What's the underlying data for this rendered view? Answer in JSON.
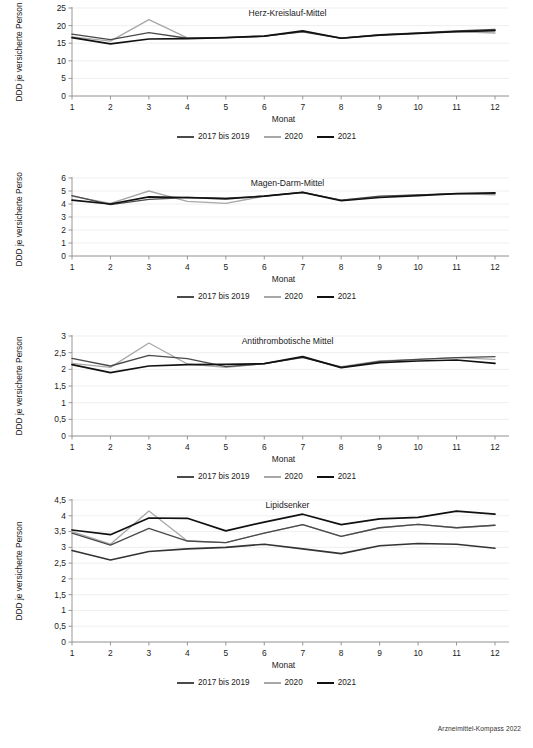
{
  "footer": {
    "source_label": "Arzneimittel-Kompass 2022"
  },
  "legend": {
    "items": [
      {
        "label": "2017 bis 2019",
        "color": "#4a4a4a"
      },
      {
        "label": "2020",
        "color": "#a8a8a8"
      },
      {
        "label": "2021",
        "color": "#111111"
      }
    ]
  },
  "axis_labels": {
    "x": "Monat",
    "y": "DDD je versicherte Person"
  },
  "chart_data": [
    {
      "type": "line",
      "title": "Herz-Kreislauf-Mittel",
      "xlabel": "Monat",
      "ylabel": "DDD je versicherte Person",
      "x": [
        1,
        2,
        3,
        4,
        5,
        6,
        7,
        8,
        9,
        10,
        11,
        12
      ],
      "categories": [
        "1",
        "2",
        "3",
        "4",
        "5",
        "6",
        "7",
        "8",
        "9",
        "10",
        "11",
        "12"
      ],
      "ylim": [
        0,
        25
      ],
      "yticks": [
        0,
        5,
        10,
        15,
        20,
        25
      ],
      "ytick_labels": [
        "0",
        "5",
        "10",
        "15",
        "20",
        "25"
      ],
      "grid": true,
      "legend_position": "bottom",
      "series": [
        {
          "name": "2017 bis 2019",
          "color": "#4a4a4a",
          "values": [
            17.6,
            16.0,
            18.0,
            16.4,
            16.6,
            17.0,
            18.2,
            16.4,
            17.4,
            17.9,
            18.5,
            18.9
          ]
        },
        {
          "name": "2020",
          "color": "#a8a8a8",
          "values": [
            16.8,
            15.6,
            21.7,
            16.5,
            16.6,
            17.0,
            18.3,
            16.5,
            17.3,
            17.8,
            18.3,
            17.9
          ]
        },
        {
          "name": "2021",
          "color": "#111111",
          "values": [
            16.6,
            14.8,
            16.2,
            16.3,
            16.6,
            17.0,
            18.5,
            16.4,
            17.3,
            17.8,
            18.3,
            18.6
          ]
        }
      ]
    },
    {
      "type": "line",
      "title": "Magen-Darm-Mittel",
      "xlabel": "Monat",
      "ylabel": "DDD je versicherte Person",
      "x": [
        1,
        2,
        3,
        4,
        5,
        6,
        7,
        8,
        9,
        10,
        11,
        12
      ],
      "categories": [
        "1",
        "2",
        "3",
        "4",
        "5",
        "6",
        "7",
        "8",
        "9",
        "10",
        "11",
        "12"
      ],
      "ylim": [
        0,
        6
      ],
      "yticks": [
        0,
        1,
        2,
        3,
        4,
        5,
        6
      ],
      "ytick_labels": [
        "0",
        "1",
        "2",
        "3",
        "4",
        "5",
        "6"
      ],
      "grid": true,
      "legend_position": "bottom",
      "series": [
        {
          "name": "2017 bis 2019",
          "color": "#4a4a4a",
          "values": [
            4.65,
            3.95,
            4.35,
            4.5,
            4.45,
            4.6,
            4.9,
            4.3,
            4.6,
            4.7,
            4.8,
            4.8
          ]
        },
        {
          "name": "2020",
          "color": "#a8a8a8",
          "values": [
            4.6,
            4.05,
            5.0,
            4.2,
            4.05,
            4.6,
            4.9,
            4.3,
            4.55,
            4.7,
            4.8,
            4.7
          ]
        },
        {
          "name": "2021",
          "color": "#111111",
          "values": [
            4.3,
            4.0,
            4.55,
            4.5,
            4.4,
            4.6,
            4.9,
            4.25,
            4.5,
            4.65,
            4.8,
            4.85
          ]
        }
      ]
    },
    {
      "type": "line",
      "title": "Antithrombotische Mittel",
      "xlabel": "Monat",
      "ylabel": "DDD je versicherte Person",
      "x": [
        1,
        2,
        3,
        4,
        5,
        6,
        7,
        8,
        9,
        10,
        11,
        12
      ],
      "categories": [
        "1",
        "2",
        "3",
        "4",
        "5",
        "6",
        "7",
        "8",
        "9",
        "10",
        "11",
        "12"
      ],
      "ylim": [
        0,
        3
      ],
      "yticks": [
        0,
        0.5,
        1,
        1.5,
        2,
        2.5,
        3
      ],
      "ytick_labels": [
        "0",
        "0,5",
        "1",
        "1,5",
        "2",
        "2,5",
        "3"
      ],
      "grid": true,
      "legend_position": "bottom",
      "series": [
        {
          "name": "2017 bis 2019",
          "color": "#4a4a4a",
          "values": [
            2.33,
            2.1,
            2.42,
            2.32,
            2.08,
            2.17,
            2.36,
            2.06,
            2.24,
            2.3,
            2.35,
            2.38
          ]
        },
        {
          "name": "2020",
          "color": "#a8a8a8",
          "values": [
            2.18,
            2.06,
            2.79,
            2.16,
            2.06,
            2.17,
            2.35,
            2.08,
            2.25,
            2.3,
            2.35,
            2.3
          ]
        },
        {
          "name": "2021",
          "color": "#111111",
          "values": [
            2.14,
            1.9,
            2.1,
            2.14,
            2.15,
            2.17,
            2.38,
            2.05,
            2.2,
            2.25,
            2.28,
            2.18
          ]
        }
      ]
    },
    {
      "type": "line",
      "title": "Lipidsenker",
      "xlabel": "Monat",
      "ylabel": "DDD je versicherte Person",
      "x": [
        1,
        2,
        3,
        4,
        5,
        6,
        7,
        8,
        9,
        10,
        11,
        12
      ],
      "categories": [
        "1",
        "2",
        "3",
        "4",
        "5",
        "6",
        "7",
        "8",
        "9",
        "10",
        "11",
        "12"
      ],
      "ylim": [
        0,
        4.5
      ],
      "yticks": [
        0,
        0.5,
        1,
        1.5,
        2,
        2.5,
        3,
        3.5,
        4,
        4.5
      ],
      "ytick_labels": [
        "0",
        "0,5",
        "1",
        "1,5",
        "2",
        "2,5",
        "3",
        "3,5",
        "4",
        "4,5"
      ],
      "grid": true,
      "legend_position": "bottom",
      "series": [
        {
          "name": "2017 bis 2019",
          "color": "#4a4a4a",
          "values": [
            3.45,
            3.07,
            3.6,
            3.2,
            3.15,
            3.45,
            3.72,
            3.35,
            3.62,
            3.73,
            3.62,
            3.7
          ]
        },
        {
          "name": "2020",
          "color": "#a8a8a8",
          "values": [
            3.5,
            3.1,
            4.15,
            3.2,
            3.15,
            3.45,
            3.72,
            3.35,
            3.62,
            3.73,
            3.62,
            3.7
          ]
        },
        {
          "name": "2021",
          "color": "#111111",
          "values": [
            3.55,
            3.4,
            3.93,
            3.92,
            3.52,
            3.8,
            4.05,
            3.72,
            3.9,
            3.95,
            4.15,
            4.05
          ]
        }
      ]
    },
    {
      "type": "line",
      "title": "__baseline_2021_lipid__",
      "hidden_note": "lower 2021-style dark line in Lipidsenker panel",
      "x": [
        1,
        2,
        3,
        4,
        5,
        6,
        7,
        8,
        9,
        10,
        11,
        12
      ],
      "series": [
        {
          "name": "2017 bis 2019",
          "color": "#333333",
          "values": [
            2.9,
            2.6,
            2.87,
            2.95,
            3.0,
            3.1,
            2.95,
            2.8,
            3.05,
            3.12,
            3.1,
            2.97
          ]
        }
      ]
    }
  ]
}
